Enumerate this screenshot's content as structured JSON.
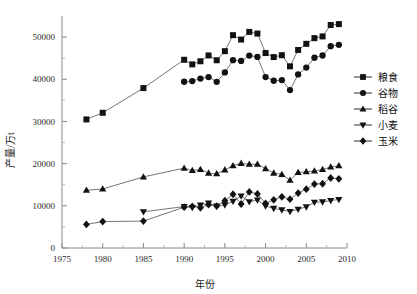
{
  "chart_data": {
    "type": "line",
    "title": "",
    "xlabel": "年份",
    "ylabel": "产量/万t",
    "xlim": [
      1975,
      2010
    ],
    "ylim": [
      0,
      55000
    ],
    "xticks": [
      1975,
      1980,
      1985,
      1990,
      1995,
      2000,
      2005,
      2010
    ],
    "yticks": [
      0,
      10000,
      20000,
      30000,
      40000,
      50000
    ],
    "ytick_labels": [
      "0",
      "10000",
      "20000",
      "30000",
      "40000",
      "50000"
    ],
    "xtick_labels": [
      "1975",
      "1980",
      "1985",
      "1990",
      "1995",
      "2000",
      "2005",
      "2010"
    ],
    "grid": false,
    "legend_position": "right",
    "series": [
      {
        "name": "粮食",
        "marker": "square",
        "x": [
          1978,
          1980,
          1985,
          1990,
          1991,
          1992,
          1993,
          1994,
          1995,
          1996,
          1997,
          1998,
          1999,
          2000,
          2001,
          2002,
          2003,
          2004,
          2005,
          2006,
          2007,
          2008,
          2009
        ],
        "values": [
          30477,
          32056,
          37911,
          44624,
          43529,
          44266,
          45649,
          44510,
          46662,
          50454,
          49417,
          51230,
          50839,
          46218,
          45264,
          45706,
          43070,
          46947,
          48402,
          49748,
          50160,
          52871,
          53082
        ]
      },
      {
        "name": "谷物",
        "marker": "circle",
        "x": [
          1990,
          1991,
          1992,
          1993,
          1994,
          1995,
          1996,
          1997,
          1998,
          1999,
          2000,
          2001,
          2002,
          2003,
          2004,
          2005,
          2006,
          2007,
          2008,
          2009
        ],
        "values": [
          39408,
          39566,
          40169,
          40517,
          39389,
          41612,
          44536,
          44349,
          45625,
          45304,
          40522,
          39648,
          39799,
          37429,
          41157,
          42776,
          45099,
          45632,
          47848,
          48156
        ]
      },
      {
        "name": "稻谷",
        "marker": "triangle-up",
        "x": [
          1978,
          1980,
          1985,
          1990,
          1991,
          1992,
          1993,
          1994,
          1995,
          1996,
          1997,
          1998,
          1999,
          2000,
          2001,
          2002,
          2003,
          2004,
          2005,
          2006,
          2007,
          2008,
          2009
        ],
        "values": [
          13693,
          13991,
          16857,
          18933,
          18381,
          18622,
          17751,
          17593,
          18523,
          19510,
          20073,
          19871,
          19849,
          18791,
          17758,
          17454,
          16066,
          17909,
          18059,
          18257,
          18603,
          19190,
          19510
        ]
      },
      {
        "name": "小麦",
        "marker": "triangle-down",
        "x": [
          1985,
          1990,
          1991,
          1992,
          1993,
          1994,
          1995,
          1996,
          1997,
          1998,
          1999,
          2000,
          2001,
          2002,
          2003,
          2004,
          2005,
          2006,
          2007,
          2008,
          2009
        ],
        "values": [
          8581,
          9823,
          9595,
          10158,
          10639,
          9930,
          10221,
          11057,
          12329,
          10973,
          11388,
          9964,
          9387,
          9029,
          8649,
          9195,
          9745,
          10847,
          10930,
          11246,
          11512
        ]
      },
      {
        "name": "玉米",
        "marker": "diamond",
        "x": [
          1978,
          1980,
          1985,
          1990,
          1991,
          1992,
          1993,
          1994,
          1995,
          1996,
          1997,
          1998,
          1999,
          2000,
          2001,
          2002,
          2003,
          2004,
          2005,
          2006,
          2007,
          2008,
          2009
        ],
        "values": [
          5595,
          6260,
          6383,
          9682,
          9877,
          9538,
          10270,
          9928,
          11199,
          12747,
          10431,
          13295,
          12809,
          10600,
          11409,
          12131,
          11583,
          13029,
          13937,
          15160,
          15230,
          16591,
          16397
        ]
      }
    ]
  },
  "legend": {
    "items": [
      {
        "label": "粮食",
        "marker": "square"
      },
      {
        "label": "谷物",
        "marker": "circle"
      },
      {
        "label": "稻谷",
        "marker": "triangle-up"
      },
      {
        "label": "小麦",
        "marker": "triangle-down"
      },
      {
        "label": "玉米",
        "marker": "diamond"
      }
    ]
  },
  "colors": {
    "marker": "#121212",
    "line": "#3b3b3b",
    "axis": "#8a8a8a",
    "text": "#1a1a1a",
    "background": "#ffffff"
  }
}
